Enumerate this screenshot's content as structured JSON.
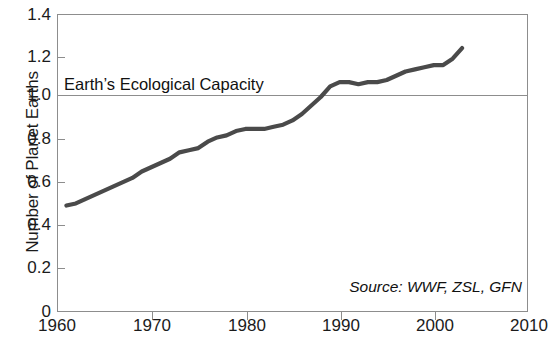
{
  "chart_data": {
    "type": "line",
    "title": "",
    "xlabel": "",
    "ylabel": "Number of Planet Earths",
    "xlim": [
      1960,
      2010
    ],
    "ylim": [
      0,
      1.4
    ],
    "grid": false,
    "legend": null,
    "xticks": [
      "1960",
      "1970",
      "1980",
      "1990",
      "2000",
      "2010"
    ],
    "yticks": [
      "1.4",
      "1.2",
      "1.0",
      "0.8",
      "0.6",
      "0.4",
      "0.2",
      "0"
    ],
    "annotations": [
      {
        "name": "capacity-line-label",
        "text": "Earth’s Ecological Capacity",
        "y_value": 1.0
      },
      {
        "name": "source-note",
        "text": "Source: WWF, ZSL, GFN"
      }
    ],
    "reference_lines": [
      {
        "label": "Earth’s Ecological Capacity",
        "value": 1.0
      }
    ],
    "series": [
      {
        "name": "Humanity's Ecological Footprint",
        "x": [
          1961,
          1962,
          1963,
          1964,
          1965,
          1966,
          1967,
          1968,
          1969,
          1970,
          1971,
          1972,
          1973,
          1974,
          1975,
          1976,
          1977,
          1978,
          1979,
          1980,
          1981,
          1982,
          1983,
          1984,
          1985,
          1986,
          1987,
          1988,
          1989,
          1990,
          1991,
          1992,
          1993,
          1994,
          1995,
          1996,
          1997,
          1998,
          1999,
          2000,
          2001,
          2002,
          2003
        ],
        "y": [
          0.5,
          0.51,
          0.53,
          0.55,
          0.57,
          0.59,
          0.61,
          0.63,
          0.66,
          0.68,
          0.7,
          0.72,
          0.75,
          0.76,
          0.77,
          0.8,
          0.82,
          0.83,
          0.85,
          0.86,
          0.86,
          0.86,
          0.87,
          0.88,
          0.9,
          0.93,
          0.97,
          1.01,
          1.06,
          1.08,
          1.08,
          1.07,
          1.08,
          1.08,
          1.09,
          1.11,
          1.13,
          1.14,
          1.15,
          1.16,
          1.16,
          1.19,
          1.24
        ]
      }
    ]
  },
  "axes": {
    "y_title": "Number of Planet Earths",
    "y_labels": [
      "1.4",
      "1.2",
      "1.0",
      "0.8",
      "0.6",
      "0.4",
      "0.2",
      "0"
    ],
    "x_labels": [
      "1960",
      "1970",
      "1980",
      "1990",
      "2000",
      "2010"
    ]
  },
  "labels": {
    "capacity": "Earth’s Ecological Capacity",
    "source": "Source: WWF, ZSL, GFN"
  },
  "colors": {
    "line": "#4a4a4a",
    "frame": "#8d8d8d",
    "text": "#1b1b1b",
    "background": "#ffffff"
  }
}
